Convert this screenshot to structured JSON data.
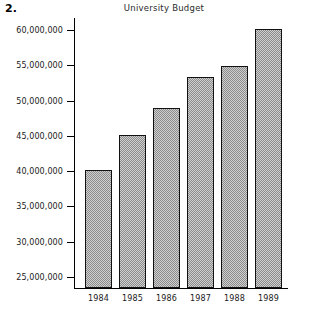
{
  "figure": {
    "number_label": "2."
  },
  "chart_data": {
    "type": "bar",
    "title": "University Budget",
    "xlabel": "",
    "ylabel": "",
    "categories": [
      "1984",
      "1985",
      "1986",
      "1987",
      "1988",
      "1989"
    ],
    "values": [
      40000000,
      45000000,
      48800000,
      53200000,
      54700000,
      60000000
    ],
    "ytick_labels": [
      "25,000,000",
      "30,000,000",
      "35,000,000",
      "40,000,000",
      "45,000,000",
      "50,000,000",
      "55,000,000",
      "60,000,000"
    ],
    "ytick_values": [
      25000000,
      30000000,
      35000000,
      40000000,
      45000000,
      50000000,
      55000000,
      60000000
    ],
    "ylim": [
      23300000,
      61700000
    ],
    "axis_truncated": true,
    "grid": false,
    "legend": false,
    "bar_fill": "#cfcfcf",
    "bar_edge": "#111111"
  }
}
